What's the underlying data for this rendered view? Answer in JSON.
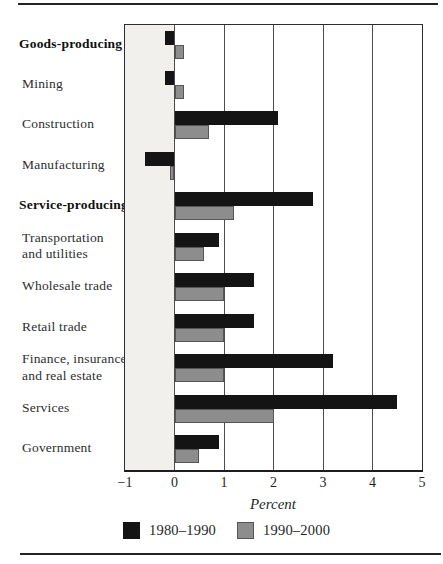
{
  "chart_data": {
    "type": "bar",
    "orientation": "horizontal",
    "title": "",
    "xlabel": "Percent",
    "xlim": [
      -1,
      5
    ],
    "x_ticks": [
      -1,
      0,
      1,
      2,
      3,
      4,
      5
    ],
    "x_tick_labels": [
      "−1",
      "0",
      "1",
      "2",
      "3",
      "4",
      "5"
    ],
    "grid": "vertical",
    "legend_position": "bottom",
    "negative_band_color": "#f1f0ec",
    "categories": [
      "Goods-producing",
      "Mining",
      "Construction",
      "Manufacturing",
      "Service-producing",
      "Transportation and utilities",
      "Wholesale trade",
      "Retail trade",
      "Finance, insurance, and real estate",
      "Services",
      "Government"
    ],
    "category_lines": [
      [
        "Goods-producing"
      ],
      [
        "Mining"
      ],
      [
        "Construction"
      ],
      [
        "Manufacturing"
      ],
      [
        "Service-producing"
      ],
      [
        "Transportation",
        "and utilities"
      ],
      [
        "Wholesale trade"
      ],
      [
        "Retail trade"
      ],
      [
        "Finance, insurance,",
        "and real estate"
      ],
      [
        "Services"
      ],
      [
        "Government"
      ]
    ],
    "bold_categories": [
      "Goods-producing",
      "Service-producing"
    ],
    "series": [
      {
        "name": "1980–1990",
        "color": "#141414",
        "values": [
          -0.2,
          -0.2,
          2.1,
          -0.6,
          2.8,
          0.9,
          1.6,
          1.6,
          3.2,
          4.5,
          0.9
        ]
      },
      {
        "name": "1990–2000",
        "color": "#8d8d8d",
        "values": [
          0.2,
          0.2,
          0.7,
          -0.1,
          1.2,
          0.6,
          1.0,
          1.0,
          1.0,
          2.0,
          0.5
        ]
      }
    ]
  }
}
